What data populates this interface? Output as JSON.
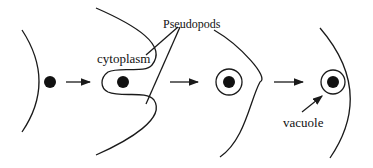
{
  "diagram": {
    "labels": {
      "pseudopods": "Pseudopods",
      "cytoplasm": "cytoplasm",
      "vacuole": "vacuole"
    },
    "stages": [
      {
        "id": 1,
        "description": "Particle approaches cell membrane"
      },
      {
        "id": 2,
        "description": "Pseudopods extend around particle"
      },
      {
        "id": 3,
        "description": "Particle enclosed in vacuole"
      },
      {
        "id": 4,
        "description": "Vacuole within cytoplasm"
      }
    ],
    "colors": {
      "stroke": "#1a1a1a",
      "background": "#ffffff"
    }
  }
}
